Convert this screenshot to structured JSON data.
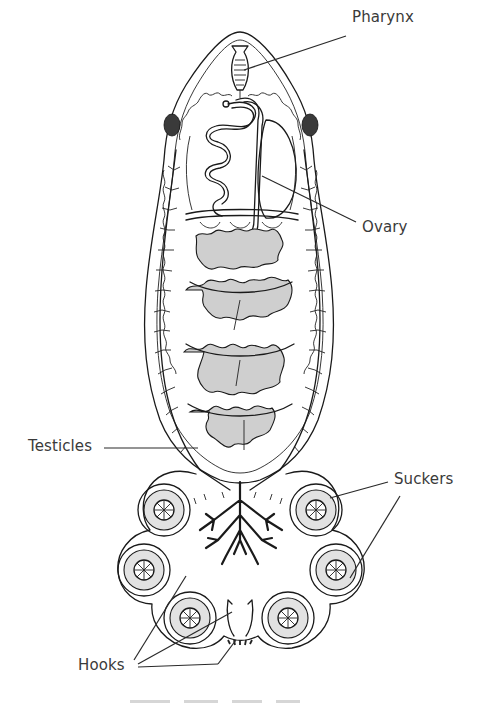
{
  "figure": {
    "labels": {
      "pharynx": "Pharynx",
      "ovary": "Ovary",
      "testicles": "Testicles",
      "suckers": "Suckers",
      "hooks": "Hooks"
    },
    "caption_visible": false,
    "colors": {
      "ink": "#1a1a1a",
      "label_text": "#3a3a3a",
      "stipple": "#cfcfcf",
      "background": "#ffffff"
    },
    "sucker_count": 6
  }
}
